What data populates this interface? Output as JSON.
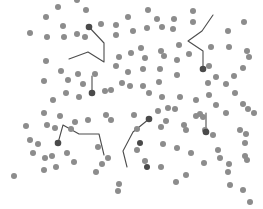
{
  "diagram": {
    "width": 263,
    "height": 209,
    "background": "#ffffff",
    "particle_color": "#8c8c8c",
    "tracked_color": "#4a4a4a",
    "trail_color": "#4d4d4d",
    "particle_radius": 3,
    "tracked_radius": 3.3,
    "trail_width": 1.1
  },
  "particles": [
    [
      77,
      0
    ],
    [
      58,
      7
    ],
    [
      86,
      10
    ],
    [
      46,
      17
    ],
    [
      63,
      26
    ],
    [
      77,
      34
    ],
    [
      30,
      33
    ],
    [
      47,
      37
    ],
    [
      64,
      37
    ],
    [
      85,
      37
    ],
    [
      116,
      35
    ],
    [
      101,
      24
    ],
    [
      116,
      25
    ],
    [
      128,
      17
    ],
    [
      148,
      10
    ],
    [
      157,
      19
    ],
    [
      162,
      27
    ],
    [
      147,
      28
    ],
    [
      174,
      19
    ],
    [
      173,
      29
    ],
    [
      193,
      11
    ],
    [
      193,
      22
    ],
    [
      244,
      22
    ],
    [
      228,
      31
    ],
    [
      133,
      31
    ],
    [
      141,
      48
    ],
    [
      161,
      51
    ],
    [
      179,
      45
    ],
    [
      145,
      58
    ],
    [
      164,
      56
    ],
    [
      177,
      60
    ],
    [
      189,
      54
    ],
    [
      211,
      47
    ],
    [
      229,
      47
    ],
    [
      247,
      51
    ],
    [
      249,
      57
    ],
    [
      131,
      53
    ],
    [
      46,
      61
    ],
    [
      61,
      71
    ],
    [
      78,
      74
    ],
    [
      119,
      57
    ],
    [
      116,
      66
    ],
    [
      128,
      72
    ],
    [
      44,
      81
    ],
    [
      68,
      80
    ],
    [
      83,
      84
    ],
    [
      66,
      93
    ],
    [
      53,
      100
    ],
    [
      79,
      97
    ],
    [
      105,
      91
    ],
    [
      111,
      90
    ],
    [
      95,
      74
    ],
    [
      122,
      83
    ],
    [
      130,
      86
    ],
    [
      143,
      69
    ],
    [
      160,
      69
    ],
    [
      177,
      75
    ],
    [
      209,
      66
    ],
    [
      216,
      77
    ],
    [
      243,
      68
    ],
    [
      208,
      83
    ],
    [
      226,
      84
    ],
    [
      234,
      76
    ],
    [
      143,
      86
    ],
    [
      159,
      82
    ],
    [
      162,
      97
    ],
    [
      180,
      97
    ],
    [
      149,
      93
    ],
    [
      168,
      108
    ],
    [
      175,
      109
    ],
    [
      196,
      100
    ],
    [
      200,
      114
    ],
    [
      203,
      117
    ],
    [
      209,
      95
    ],
    [
      216,
      105
    ],
    [
      226,
      113
    ],
    [
      243,
      104
    ],
    [
      248,
      109
    ],
    [
      254,
      113
    ],
    [
      235,
      93
    ],
    [
      44,
      113
    ],
    [
      47,
      125
    ],
    [
      60,
      116
    ],
    [
      55,
      128
    ],
    [
      71,
      129
    ],
    [
      75,
      122
    ],
    [
      88,
      120
    ],
    [
      106,
      115
    ],
    [
      111,
      120
    ],
    [
      134,
      115
    ],
    [
      137,
      129
    ],
    [
      158,
      111
    ],
    [
      161,
      127
    ],
    [
      166,
      121
    ],
    [
      184,
      125
    ],
    [
      186,
      130
    ],
    [
      196,
      116
    ],
    [
      205,
      130
    ],
    [
      213,
      135
    ],
    [
      218,
      150
    ],
    [
      240,
      130
    ],
    [
      246,
      134
    ],
    [
      245,
      143
    ],
    [
      26,
      126
    ],
    [
      30,
      140
    ],
    [
      38,
      144
    ],
    [
      33,
      153
    ],
    [
      45,
      158
    ],
    [
      44,
      170
    ],
    [
      52,
      156
    ],
    [
      56,
      167
    ],
    [
      67,
      153
    ],
    [
      74,
      162
    ],
    [
      96,
      172
    ],
    [
      108,
      158
    ],
    [
      137,
      150
    ],
    [
      145,
      161
    ],
    [
      161,
      167
    ],
    [
      163,
      144
    ],
    [
      177,
      148
    ],
    [
      186,
      175
    ],
    [
      176,
      182
    ],
    [
      191,
      153
    ],
    [
      204,
      163
    ],
    [
      220,
      158
    ],
    [
      229,
      164
    ],
    [
      228,
      172
    ],
    [
      245,
      156
    ],
    [
      247,
      160
    ],
    [
      230,
      185
    ],
    [
      243,
      190
    ],
    [
      250,
      202
    ],
    [
      14,
      176
    ],
    [
      102,
      164
    ],
    [
      98,
      147
    ],
    [
      119,
      184
    ],
    [
      118,
      191
    ]
  ],
  "tracked": [
    {
      "id": 1,
      "head": [
        89,
        27
      ],
      "trail": [
        [
          89,
          27
        ],
        [
          104,
          43
        ],
        [
          104,
          62
        ],
        [
          88,
          52
        ],
        [
          69,
          59
        ]
      ]
    },
    {
      "id": 2,
      "head": [
        203,
        69
      ],
      "trail": [
        [
          203,
          69
        ],
        [
          203,
          51
        ],
        [
          188,
          41
        ],
        [
          202,
          31
        ],
        [
          213,
          15
        ]
      ]
    },
    {
      "id": 3,
      "head": [
        92,
        93
      ],
      "trail": [
        [
          92,
          93
        ],
        [
          92,
          76
        ]
      ]
    },
    {
      "id": 4,
      "head": [
        149,
        119
      ],
      "trail": [
        [
          149,
          119
        ],
        [
          133,
          132
        ],
        [
          123,
          151
        ],
        [
          127,
          167
        ]
      ]
    },
    {
      "id": 5,
      "head": [
        58,
        143
      ],
      "trail": [
        [
          58,
          143
        ],
        [
          63,
          125
        ],
        [
          79,
          134
        ],
        [
          99,
          134
        ],
        [
          104,
          155
        ]
      ]
    },
    {
      "id": 6,
      "head": [
        206,
        132
      ],
      "trail": [
        [
          206,
          132
        ],
        [
          206,
          113
        ]
      ]
    }
  ],
  "extra_dark_particles": [
    [
      147,
      167
    ],
    [
      140,
      143
    ]
  ]
}
